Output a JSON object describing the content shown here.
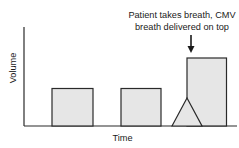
{
  "diagram": {
    "annotation": {
      "line1": "Patient takes breath, CMV",
      "line2": "breath delivered on top"
    },
    "axes": {
      "xlabel": "Time",
      "ylabel": "Volume"
    },
    "colors": {
      "fill": "#e6e6e6",
      "stroke": "#2a2a2a",
      "text": "#1a1a1a"
    },
    "breaths": [
      {
        "type": "mandatory",
        "label": "CMV breath 1"
      },
      {
        "type": "mandatory",
        "label": "CMV breath 2"
      },
      {
        "type": "spontaneous+mandatory",
        "label": "Patient breath with CMV breath stacked"
      }
    ]
  }
}
